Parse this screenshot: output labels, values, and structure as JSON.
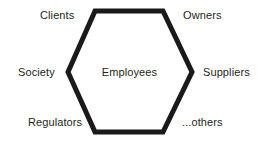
{
  "diagram": {
    "type": "hexagon-stakeholder-map",
    "center": {
      "label": "Employees"
    },
    "nodes": [
      {
        "id": "clients",
        "label": "Clients",
        "position": "top-left"
      },
      {
        "id": "owners",
        "label": "Owners",
        "position": "top-right"
      },
      {
        "id": "society",
        "label": "Society",
        "position": "middle-left"
      },
      {
        "id": "suppliers",
        "label": "Suppliers",
        "position": "middle-right"
      },
      {
        "id": "regulators",
        "label": "Regulators",
        "position": "bottom-left"
      },
      {
        "id": "others",
        "label": "...others",
        "position": "bottom-right"
      }
    ],
    "shape": {
      "name": "hexagon",
      "stroke_color": "#1a1a1a",
      "fill_color": "#ffffff",
      "stroke_width": 5,
      "points": "95,11 163,11 192,72 163,132 95,132 68,72"
    },
    "background_color": "#ffffff"
  }
}
